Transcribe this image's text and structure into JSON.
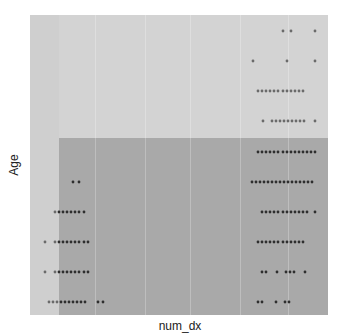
{
  "chart_data": {
    "type": "scatter",
    "title": "",
    "xlabel": "num_dx",
    "ylabel": "Age",
    "grid": true,
    "legend": null,
    "x_ticks": [],
    "y_ticks": [],
    "colors": {
      "background": "#d3d3d3",
      "shaded_region": "#a9a9a9",
      "points": "#3a3a3a"
    },
    "shaded_region": {
      "x_from_px": 59,
      "y_from_px": 138,
      "note": "darker rectangle covering lower portion from left boundary band to right edge"
    },
    "rows": [
      {
        "row": 1,
        "y_px": 31,
        "x_px": [
          283,
          291,
          315
        ]
      },
      {
        "row": 2,
        "y_px": 61,
        "x_px": [
          253,
          287,
          315
        ]
      },
      {
        "row": 3,
        "y_px": 91,
        "x_px": [
          258,
          262,
          266,
          270,
          274,
          278,
          283,
          287,
          291,
          295,
          299,
          303
        ]
      },
      {
        "row": 4,
        "y_px": 121,
        "x_px": [
          263,
          272,
          276,
          280,
          284,
          288,
          292,
          296,
          300,
          304,
          315
        ]
      },
      {
        "row": 5,
        "y_px": 152,
        "x_px": [
          258,
          262,
          266,
          270,
          274,
          278,
          283,
          287,
          291,
          295,
          299,
          303,
          307,
          311,
          315
        ]
      },
      {
        "row": 6,
        "y_px": 182,
        "x_px": [
          73,
          79,
          252,
          256,
          260,
          264,
          268,
          272,
          276,
          280,
          284,
          288,
          292,
          296,
          300,
          304,
          308,
          312
        ]
      },
      {
        "row": 7,
        "y_px": 212,
        "x_px": [
          55,
          59,
          63,
          67,
          71,
          75,
          79,
          84,
          262,
          266,
          270,
          274,
          278,
          283,
          287,
          291,
          295,
          299,
          303,
          307,
          315
        ]
      },
      {
        "row": 8,
        "y_px": 242,
        "x_px": [
          45,
          55,
          59,
          63,
          67,
          71,
          75,
          79,
          84,
          88,
          258,
          262,
          266,
          270,
          274,
          278,
          283,
          287,
          291,
          295,
          299,
          303
        ]
      },
      {
        "row": 9,
        "y_px": 272,
        "x_px": [
          45,
          55,
          59,
          63,
          67,
          71,
          75,
          79,
          84,
          88,
          262,
          266,
          277,
          286,
          290,
          294,
          305
        ]
      },
      {
        "row": 10,
        "y_px": 302,
        "x_px": [
          49,
          53,
          57,
          61,
          65,
          69,
          73,
          77,
          81,
          85,
          98,
          103,
          258,
          262,
          276,
          285,
          289
        ]
      }
    ]
  },
  "axes": {
    "x_label": "num_dx",
    "y_label": "Age"
  }
}
